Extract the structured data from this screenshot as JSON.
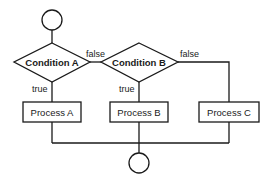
{
  "diagram": {
    "type": "flowchart",
    "nodes": {
      "start": {
        "kind": "terminal-circle"
      },
      "condition_a": {
        "kind": "decision",
        "label": "Condition A"
      },
      "condition_b": {
        "kind": "decision",
        "label": "Condition B"
      },
      "process_a": {
        "kind": "process",
        "label": "Process A"
      },
      "process_b": {
        "kind": "process",
        "label": "Process B"
      },
      "process_c": {
        "kind": "process",
        "label": "Process C"
      },
      "end": {
        "kind": "terminal-circle"
      }
    },
    "edges": {
      "a_true": {
        "from": "condition_a",
        "to": "process_a",
        "label": "true"
      },
      "a_false": {
        "from": "condition_a",
        "to": "condition_b",
        "label": "false"
      },
      "b_true": {
        "from": "condition_b",
        "to": "process_b",
        "label": "true"
      },
      "b_false": {
        "from": "condition_b",
        "to": "process_c",
        "label": "false"
      }
    }
  }
}
